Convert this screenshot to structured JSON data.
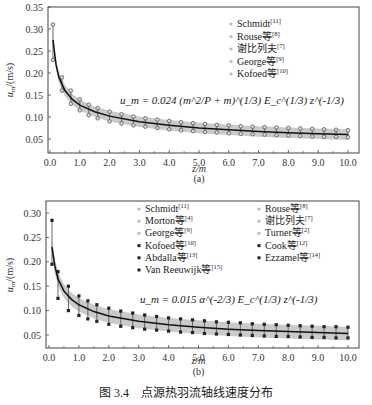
{
  "figure": {
    "caption": "图 3.4　点源热羽流轴线速度分布",
    "panel_a_label": "(a)",
    "panel_b_label": "(b)"
  },
  "chart_data": [
    {
      "type": "line",
      "panel": "(a)",
      "title": "",
      "xlabel": "z/m",
      "ylabel": "u_m/(m/s)",
      "xlim": [
        0,
        10
      ],
      "ylim": [
        0.02,
        0.35
      ],
      "xticks": [
        "0.0",
        "1.0",
        "2.0",
        "3.0",
        "4.0",
        "5.0",
        "6.0",
        "7.0",
        "8.0",
        "9.0",
        "10.0"
      ],
      "yticks": [
        "0.05",
        "0.10",
        "0.15",
        "0.20",
        "0.25",
        "0.30",
        "0.35"
      ],
      "grid": false,
      "legend_position": "upper right",
      "legend": [
        "Schmidt[11]",
        "Rouse等[8]",
        "谢比列夫[7]",
        "George等[9]",
        "Kofoed等[10]"
      ],
      "annotation": "u_m = 0.024 (m^2/P + m)^(1/3) E_c^(1/3) z^(-1/3)",
      "fit_curve": {
        "x": [
          0.1,
          0.2,
          0.3,
          0.5,
          0.75,
          1,
          1.5,
          2,
          3,
          4,
          5,
          6,
          7,
          8,
          9,
          10
        ],
        "y": [
          0.275,
          0.22,
          0.19,
          0.16,
          0.14,
          0.127,
          0.112,
          0.102,
          0.089,
          0.081,
          0.075,
          0.071,
          0.067,
          0.064,
          0.062,
          0.06
        ]
      },
      "band": {
        "upper_offset": 0.012,
        "lower_offset": 0.012
      },
      "series": [
        {
          "name": "upper data",
          "x": [
            0.1,
            0.4,
            0.7,
            1.0,
            1.3,
            1.6,
            2,
            2.4,
            2.8,
            3.2,
            3.6,
            4,
            4.4,
            4.8,
            5.2,
            5.6,
            6,
            6.4,
            6.8,
            7.2,
            7.6,
            8,
            8.4,
            8.8,
            9.2,
            9.6,
            10
          ],
          "y": [
            0.31,
            0.19,
            0.16,
            0.14,
            0.128,
            0.12,
            0.112,
            0.106,
            0.101,
            0.097,
            0.094,
            0.091,
            0.088,
            0.086,
            0.084,
            0.082,
            0.081,
            0.079,
            0.078,
            0.077,
            0.076,
            0.075,
            0.074,
            0.073,
            0.072,
            0.071,
            0.07
          ]
        },
        {
          "name": "lower data",
          "x": [
            0.1,
            0.4,
            0.7,
            1.0,
            1.3,
            1.6,
            2,
            2.4,
            2.8,
            3.2,
            3.6,
            4,
            4.4,
            4.8,
            5.2,
            5.6,
            6,
            6.4,
            6.8,
            7.2,
            7.6,
            8,
            8.4,
            8.8,
            9.2,
            9.6,
            10
          ],
          "y": [
            0.23,
            0.16,
            0.13,
            0.115,
            0.104,
            0.097,
            0.09,
            0.085,
            0.081,
            0.078,
            0.075,
            0.072,
            0.07,
            0.068,
            0.066,
            0.065,
            0.063,
            0.062,
            0.061,
            0.06,
            0.059,
            0.058,
            0.057,
            0.056,
            0.055,
            0.055,
            0.054
          ]
        }
      ]
    },
    {
      "type": "line",
      "panel": "(b)",
      "title": "",
      "xlabel": "z/m",
      "ylabel": "u_m/(m/s)",
      "xlim": [
        0,
        10
      ],
      "ylim": [
        0.02,
        0.32
      ],
      "xticks": [
        "0.0",
        "1.0",
        "2.0",
        "3.0",
        "4.0",
        "5.0",
        "6.0",
        "7.0",
        "8.0",
        "9.0",
        "10.0"
      ],
      "yticks": [
        "0.05",
        "0.10",
        "0.15",
        "0.20",
        "0.25",
        "0.30"
      ],
      "grid": false,
      "legend_position": "top",
      "legend": [
        "Schmidt[11]",
        "Morton等[4]",
        "George等[9]",
        "Kofoed等[10]",
        "Abdalla等[13]",
        "Van Reeuwijk等[15]",
        "Rouse等[8]",
        "谢比列夫[7]",
        "Turner等[2]",
        "Cook等[12]",
        "Ezzamel等[14]"
      ],
      "annotation": "u_m = 0.015 α^(-2/3) E_c^(1/3) z^(-1/3)",
      "fit_curve": {
        "x": [
          0.1,
          0.2,
          0.3,
          0.5,
          0.75,
          1,
          1.5,
          2,
          3,
          4,
          5,
          6,
          7,
          8,
          9,
          10
        ],
        "y": [
          0.23,
          0.19,
          0.165,
          0.14,
          0.123,
          0.112,
          0.098,
          0.089,
          0.078,
          0.071,
          0.066,
          0.062,
          0.059,
          0.057,
          0.055,
          0.053
        ]
      },
      "band": {
        "upper_offset": 0.014,
        "lower_offset": 0.014
      },
      "series": [
        {
          "name": "upper data",
          "x": [
            0.1,
            0.3,
            0.65,
            1.0,
            1.3,
            1.6,
            2,
            2.4,
            2.8,
            3.2,
            3.6,
            4,
            4.4,
            4.8,
            5.2,
            5.6,
            6,
            6.4,
            6.8,
            7.2,
            7.6,
            8,
            8.4,
            8.8,
            9.2,
            9.6,
            10
          ],
          "y": [
            0.285,
            0.18,
            0.15,
            0.13,
            0.12,
            0.112,
            0.105,
            0.099,
            0.095,
            0.091,
            0.088,
            0.085,
            0.083,
            0.081,
            0.079,
            0.077,
            0.076,
            0.075,
            0.073,
            0.072,
            0.071,
            0.07,
            0.069,
            0.068,
            0.067,
            0.067,
            0.066
          ]
        },
        {
          "name": "lower data",
          "x": [
            0.1,
            0.3,
            0.65,
            1.0,
            1.3,
            1.6,
            2,
            2.4,
            2.8,
            3.2,
            3.6,
            4,
            4.4,
            4.8,
            5.2,
            5.6,
            6,
            6.4,
            6.8,
            7.2,
            7.6,
            8,
            8.4,
            8.8,
            9.2,
            9.6,
            10
          ],
          "y": [
            0.195,
            0.125,
            0.1,
            0.09,
            0.083,
            0.078,
            0.072,
            0.068,
            0.065,
            0.062,
            0.06,
            0.058,
            0.056,
            0.055,
            0.053,
            0.052,
            0.051,
            0.05,
            0.049,
            0.048,
            0.047,
            0.047,
            0.046,
            0.045,
            0.045,
            0.044,
            0.044
          ]
        }
      ]
    }
  ]
}
